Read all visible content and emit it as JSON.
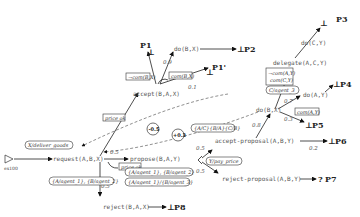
{
  "start": {
    "label": "ex100"
  },
  "nodes": {
    "request": "request(A,B,X)",
    "propose": "propose(B,A,Y)",
    "accept": "accept(B,A,X)",
    "do_BX_top": "do(B,X)",
    "reject": "reject(B,A,X)",
    "reject_proposal": "reject-proposal(A,B,Y)",
    "accept_proposal": "accept-proposal(A,B,Y)",
    "do_BX_right": "do(B,X)",
    "delegate": "delegate(A,C,Y)",
    "do_CY": "do(C,Y)",
    "do_AY": "do(A,Y)"
  },
  "terminals": {
    "P1": "P1",
    "P1prime": "P1'",
    "P2": "P2",
    "P3": "P3",
    "P4": "P4",
    "P5": "P5",
    "P6": "P6",
    "P7": "P7",
    "P8": "P8",
    "bottom_symbol": "⊥",
    "unknown_symbol": "?"
  },
  "probabilities": {
    "accept_to_do": "0.9",
    "accept_to_P1prime": "0.1",
    "request_to_propose": "0.5",
    "request_to_reject": "0.5",
    "propose_to_accept_proposal": "0.5",
    "propose_to_reject_proposal": "0.5",
    "accept_proposal_to_do": "0.8",
    "accept_proposal_to_P6": "0.2",
    "do_to_do_AY": "0.7",
    "do_to_P5": "0.3"
  },
  "conditions": {
    "not_com_BX": "¬com(B,X)",
    "com_BX": "com(B,X)",
    "price_ok_1": "price ok",
    "price_ok_2": "price ok",
    "deliver_goods": "X/deliver_goods",
    "agent_bind_1": "{A/agent_1}, {B/agent_2}",
    "agent_bind_2": "{A/agent_1}, {B/agent_2}",
    "agent_bind_3": "{A/agent_1}/{B/agent_3}",
    "y_pay_price": "Y/pay_price",
    "substitution": "{A/C}{B/A}{C/B}",
    "c_agent": "C/agent_3",
    "not_com_AY": "¬com(A,Y)",
    "com_CY": "com(C,Y)",
    "com_AY": "com(A,Y)"
  },
  "weights": {
    "w1": "-0.5",
    "w2": "+0.3"
  }
}
